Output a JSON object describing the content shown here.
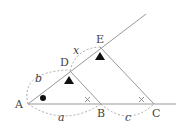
{
  "diagram": {
    "type": "geometry-similar-triangles",
    "points": {
      "A": {
        "label": "A",
        "x": 28,
        "y": 104
      },
      "B": {
        "label": "B",
        "x": 101,
        "y": 104
      },
      "C": {
        "label": "C",
        "x": 154,
        "y": 104
      },
      "D": {
        "label": "D",
        "x": 70,
        "y": 71
      },
      "E": {
        "label": "E",
        "x": 100,
        "y": 47
      }
    },
    "segment_labels": {
      "a": "a",
      "b": "b",
      "c": "c",
      "x": "x"
    },
    "angle_marks": {
      "at_A": "filled-circle",
      "at_D": "filled-triangle",
      "at_E": "filled-triangle",
      "at_B": "cross",
      "at_C": "cross"
    },
    "colors": {
      "line": "#999999",
      "dashed": "#aaaaaa",
      "mark": "#111111",
      "text": "#444444"
    }
  }
}
